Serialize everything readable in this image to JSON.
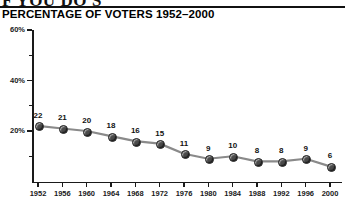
{
  "page": {
    "cut_headline": "F YOU DO'S",
    "title": "PERCENTAGE OF VOTERS 1952–2000"
  },
  "chart_data": {
    "type": "line",
    "title": "PERCENTAGE OF VOTERS 1952–2000",
    "xlabel": "",
    "ylabel": "",
    "categories": [
      "1952",
      "1956",
      "1960",
      "1964",
      "1968",
      "1972",
      "1976",
      "1980",
      "1984",
      "1988",
      "1992",
      "1996",
      "2000"
    ],
    "values": [
      22,
      21,
      20,
      18,
      16,
      15,
      11,
      9,
      10,
      8,
      8,
      9,
      6
    ],
    "data_labels": [
      "22",
      "21",
      "20",
      "18",
      "16",
      "15",
      "11",
      "9",
      "10",
      "8",
      "8",
      "9",
      "6"
    ],
    "ylim": [
      0,
      60
    ],
    "y_ticks_major": [
      20,
      40,
      60
    ],
    "y_tick_labels": [
      "20%",
      "40%",
      "60%"
    ],
    "y_ticks_minor": [
      10,
      30,
      50
    ],
    "grid": false,
    "legend": null,
    "marker": "circle",
    "line_color": "#8a8a8a",
    "marker_color": "#4a4a4a",
    "axis_color": "#1a1a1a",
    "background": "#ffffff"
  }
}
